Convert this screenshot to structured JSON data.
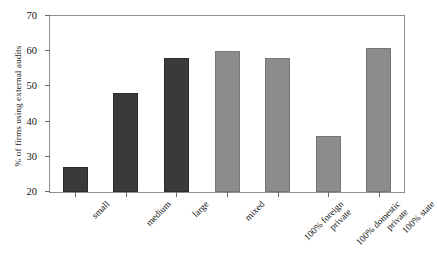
{
  "chart_data": {
    "type": "bar",
    "title": "",
    "xlabel": "",
    "ylabel": "% of firms using external audits",
    "ylim": [
      20,
      70
    ],
    "yticks": [
      20,
      30,
      40,
      50,
      60,
      70
    ],
    "grid": false,
    "legend": "none",
    "categories": [
      "small",
      "medium",
      "large",
      "mixed",
      "100% foreign private",
      "100% domestic private",
      "100% state"
    ],
    "category_lines": [
      [
        "small"
      ],
      [
        "medium"
      ],
      [
        "large"
      ],
      [
        "mixed"
      ],
      [
        "100% foreign",
        "private"
      ],
      [
        "100% domestic",
        "private"
      ],
      [
        "100% state"
      ]
    ],
    "values": [
      27,
      48,
      58,
      60,
      58,
      36,
      61
    ],
    "bar_colors": [
      "#3a3a3a",
      "#3a3a3a",
      "#3a3a3a",
      "#8c8c8c",
      "#8c8c8c",
      "#8c8c8c",
      "#8c8c8c"
    ],
    "group_shades": {
      "size": "#3a3a3a",
      "ownership": "#8c8c8c"
    }
  },
  "axis": {
    "frame_color": "#8e8e8e",
    "tick_color": "#6a6a6a",
    "text_color": "#111111"
  }
}
